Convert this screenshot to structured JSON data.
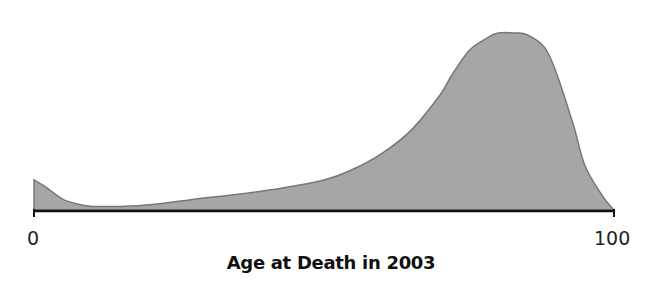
{
  "chart_data": {
    "type": "area",
    "title": "",
    "xlabel": "Age at Death in 2003",
    "ylabel": "",
    "xlim": [
      0,
      100
    ],
    "x_tick_labels": [
      "0",
      "100"
    ],
    "grid": false,
    "legend": null,
    "fill_color": "#a6a6a6",
    "stroke_color": "#777777",
    "axis_color": "#111111",
    "x": [
      0,
      2,
      5,
      8,
      10,
      12,
      15,
      20,
      30,
      40,
      50,
      55,
      60,
      65,
      70,
      72,
      75,
      78,
      80,
      83,
      85,
      88,
      90,
      93,
      95,
      98,
      100
    ],
    "values": [
      0.17,
      0.13,
      0.06,
      0.03,
      0.02,
      0.02,
      0.02,
      0.03,
      0.07,
      0.11,
      0.17,
      0.23,
      0.32,
      0.45,
      0.65,
      0.76,
      0.9,
      0.97,
      1.0,
      1.0,
      0.99,
      0.92,
      0.78,
      0.48,
      0.25,
      0.08,
      0.0
    ]
  },
  "axis": {
    "min_label": "0",
    "max_label": "100",
    "title": "Age at Death in 2003"
  }
}
